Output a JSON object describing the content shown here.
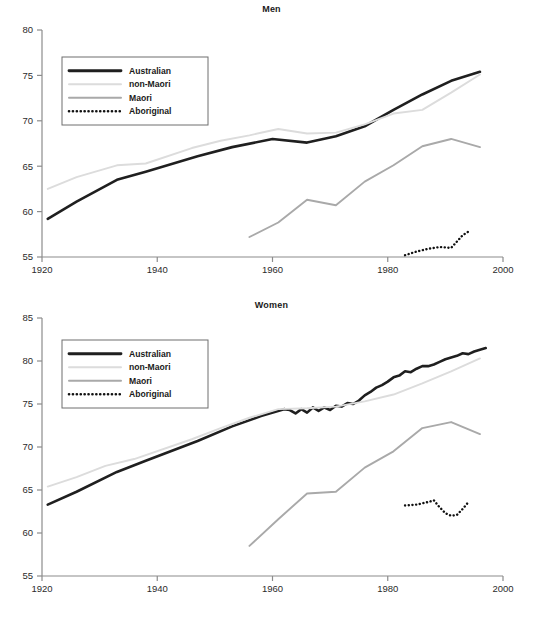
{
  "figure": {
    "width": 543,
    "height": 617,
    "background": "#ffffff"
  },
  "colors": {
    "australian": "#1f1f1f",
    "non_maori": "#dcdcdc",
    "maori": "#a9a9a9",
    "aboriginal": "#111111",
    "axis": "#8c8c8c",
    "text": "#1a1a1a",
    "legend_border": "#6e6e6e"
  },
  "legend": {
    "position": "upper-left",
    "entries": [
      {
        "label": "Australian",
        "style": "solid-thick",
        "color": "#1f1f1f"
      },
      {
        "label": "non-Maori",
        "style": "solid-thin",
        "color": "#dcdcdc"
      },
      {
        "label": "Maori",
        "style": "solid-thin",
        "color": "#a9a9a9"
      },
      {
        "label": "Aboriginal",
        "style": "dotted",
        "color": "#111111"
      }
    ]
  },
  "chart_data": [
    {
      "type": "line",
      "title": "Men",
      "xlabel": "",
      "ylabel": "",
      "xlim": [
        1920,
        2000
      ],
      "ylim": [
        55,
        80
      ],
      "xticks": [
        1920,
        1940,
        1960,
        1980,
        2000
      ],
      "yticks": [
        55,
        60,
        65,
        70,
        75,
        80
      ],
      "xtick_labels": [
        "1920",
        "1940",
        "1960",
        "1980",
        "2000"
      ],
      "ytick_labels": [
        "55",
        "60",
        "65",
        "70",
        "75",
        "80"
      ],
      "grid": false,
      "legend_position": "upper-left",
      "series": [
        {
          "name": "Australian",
          "color": "#1f1f1f",
          "style": "solid-thick",
          "x": [
            1921,
            1926,
            1933,
            1938,
            1947,
            1953,
            1960,
            1966,
            1971,
            1976,
            1981,
            1986,
            1991,
            1996
          ],
          "values": [
            59.2,
            61.1,
            63.5,
            64.4,
            66.1,
            67.1,
            68.0,
            67.6,
            68.3,
            69.4,
            71.2,
            72.9,
            74.4,
            75.4
          ]
        },
        {
          "name": "non-Maori",
          "color": "#dcdcdc",
          "style": "solid-thin",
          "x": [
            1921,
            1926,
            1933,
            1938,
            1946,
            1951,
            1956,
            1961,
            1966,
            1971,
            1976,
            1981,
            1986,
            1991,
            1996
          ],
          "values": [
            62.5,
            63.8,
            65.1,
            65.3,
            67.0,
            67.8,
            68.4,
            69.1,
            68.6,
            68.7,
            69.6,
            70.8,
            71.2,
            73.1,
            75.1
          ]
        },
        {
          "name": "Maori",
          "color": "#a9a9a9",
          "style": "solid-thin",
          "x": [
            1956,
            1961,
            1966,
            1971,
            1976,
            1981,
            1986,
            1991,
            1996
          ],
          "values": [
            57.2,
            58.8,
            61.3,
            60.7,
            63.3,
            65.1,
            67.2,
            68.0,
            67.1
          ]
        },
        {
          "name": "Aboriginal",
          "color": "#111111",
          "style": "dotted",
          "x": [
            1983,
            1985,
            1987,
            1989,
            1991,
            1993,
            1994
          ],
          "values": [
            55.2,
            55.6,
            55.9,
            56.1,
            56.0,
            57.4,
            57.8
          ]
        }
      ]
    },
    {
      "type": "line",
      "title": "Women",
      "xlabel": "",
      "ylabel": "",
      "xlim": [
        1920,
        2000
      ],
      "ylim": [
        55,
        85
      ],
      "xticks": [
        1920,
        1940,
        1960,
        1980,
        2000
      ],
      "yticks": [
        55,
        60,
        65,
        70,
        75,
        80,
        85
      ],
      "xtick_labels": [
        "1920",
        "1940",
        "1960",
        "1980",
        "2000"
      ],
      "ytick_labels": [
        "55",
        "60",
        "65",
        "70",
        "75",
        "80",
        "85"
      ],
      "grid": false,
      "legend_position": "upper-left",
      "series": [
        {
          "name": "Australian",
          "color": "#1f1f1f",
          "style": "solid-thick",
          "x": [
            1921,
            1926,
            1933,
            1938,
            1947,
            1953,
            1958,
            1962,
            1963,
            1964,
            1965,
            1966,
            1967,
            1968,
            1969,
            1970,
            1971,
            1972,
            1973,
            1974,
            1975,
            1976,
            1977,
            1978,
            1979,
            1980,
            1981,
            1982,
            1983,
            1984,
            1985,
            1986,
            1987,
            1988,
            1989,
            1990,
            1991,
            1992,
            1993,
            1994,
            1995,
            1996,
            1997
          ],
          "values": [
            63.3,
            64.8,
            67.1,
            68.4,
            70.7,
            72.4,
            73.6,
            74.4,
            74.3,
            73.9,
            74.4,
            74.0,
            74.6,
            74.2,
            74.6,
            74.3,
            74.8,
            74.7,
            75.1,
            75.0,
            75.4,
            76.0,
            76.4,
            76.9,
            77.2,
            77.6,
            78.1,
            78.3,
            78.8,
            78.7,
            79.1,
            79.4,
            79.4,
            79.6,
            79.9,
            80.2,
            80.4,
            80.6,
            80.9,
            80.8,
            81.1,
            81.3,
            81.5
          ]
        },
        {
          "name": "non-Maori",
          "color": "#dcdcdc",
          "style": "solid-thin",
          "x": [
            1921,
            1926,
            1931,
            1936,
            1946,
            1951,
            1956,
            1961,
            1966,
            1971,
            1976,
            1981,
            1986,
            1991,
            1996
          ],
          "values": [
            65.4,
            66.5,
            67.8,
            68.6,
            70.9,
            72.2,
            73.4,
            74.4,
            74.5,
            74.7,
            75.3,
            76.1,
            77.4,
            78.8,
            80.3
          ]
        },
        {
          "name": "Maori",
          "color": "#a9a9a9",
          "style": "solid-thin",
          "x": [
            1956,
            1961,
            1966,
            1971,
            1976,
            1981,
            1986,
            1991,
            1996
          ],
          "values": [
            58.5,
            61.6,
            64.6,
            64.8,
            67.6,
            69.5,
            72.2,
            72.9,
            71.5
          ]
        },
        {
          "name": "Aboriginal",
          "color": "#111111",
          "style": "dotted",
          "x": [
            1983,
            1985,
            1987,
            1988,
            1989,
            1990,
            1991,
            1992,
            1993,
            1994
          ],
          "values": [
            63.2,
            63.3,
            63.6,
            63.8,
            63.0,
            62.3,
            62.0,
            62.1,
            62.8,
            63.6
          ]
        }
      ]
    }
  ]
}
